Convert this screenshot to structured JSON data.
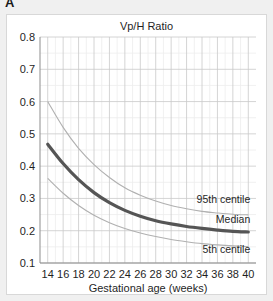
{
  "panel": {
    "letter": "A"
  },
  "chart_data": {
    "type": "line",
    "title": "Vp/H Ratio",
    "xlabel": "Gestational age (weeks)",
    "ylabel": "",
    "xlim": [
      13,
      41
    ],
    "ylim": [
      0.1,
      0.8
    ],
    "grid": true,
    "legend_position": "inline-right",
    "x_ticks": [
      14,
      16,
      18,
      20,
      22,
      24,
      26,
      28,
      30,
      32,
      34,
      36,
      38,
      40
    ],
    "x_tick_labels": [
      "14",
      "16",
      "18",
      "20",
      "22",
      "24",
      "26",
      "28",
      "30",
      "32",
      "34",
      "36",
      "38",
      "40"
    ],
    "y_ticks": [
      0.1,
      0.2,
      0.3,
      0.4,
      0.5,
      0.6,
      0.7,
      0.8
    ],
    "y_tick_labels": [
      "0.1",
      "0.2",
      "0.3",
      "0.4",
      "0.5",
      "0.6",
      "0.7",
      "0.8"
    ],
    "x": [
      14,
      16,
      18,
      20,
      22,
      24,
      26,
      28,
      30,
      32,
      34,
      36,
      38,
      40
    ],
    "series": [
      {
        "name": "95th centile",
        "color": "#b0b0b0",
        "width": 1.1,
        "label": "95th centile",
        "values": [
          0.6,
          0.52,
          0.455,
          0.405,
          0.365,
          0.333,
          0.31,
          0.292,
          0.278,
          0.268,
          0.26,
          0.255,
          0.251,
          0.249
        ]
      },
      {
        "name": "Median",
        "color": "#555555",
        "width": 3.2,
        "label": "Median",
        "values": [
          0.468,
          0.408,
          0.358,
          0.318,
          0.287,
          0.263,
          0.245,
          0.231,
          0.221,
          0.213,
          0.207,
          0.202,
          0.198,
          0.196
        ]
      },
      {
        "name": "5th centile",
        "color": "#b0b0b0",
        "width": 1.1,
        "label": "5th centile",
        "values": [
          0.362,
          0.316,
          0.278,
          0.248,
          0.225,
          0.207,
          0.193,
          0.182,
          0.173,
          0.166,
          0.16,
          0.156,
          0.153,
          0.151
        ]
      }
    ],
    "annotations": [
      {
        "text": "95th centile",
        "x": 40,
        "y": 0.285
      },
      {
        "text": "Median",
        "x": 40,
        "y": 0.225
      },
      {
        "text": "5th centile",
        "x": 40,
        "y": 0.132
      }
    ],
    "colors": {
      "median": "#555555",
      "centile": "#b0b0b0",
      "grid_major": "#c9c9c9",
      "grid_minor": "#ececec",
      "axis": "#8d8d8d",
      "text": "#1f1f1f",
      "card": "#ffffff",
      "page": "#f0f0f0"
    }
  }
}
